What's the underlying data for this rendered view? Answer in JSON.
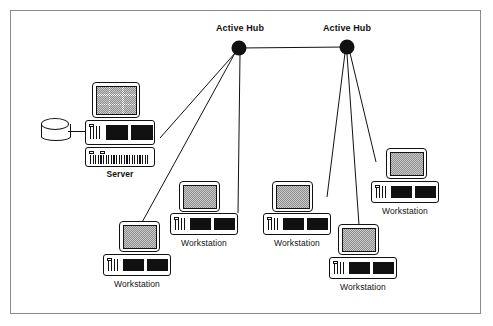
{
  "diagram": {
    "background": "#ffffff",
    "frame_color": "#8a8a8a",
    "line_color": "#111111"
  },
  "hubs": [
    {
      "id": "hub-left",
      "label": "Active Hub",
      "x": 239,
      "y": 48,
      "radius": 7
    },
    {
      "id": "hub-right",
      "label": "Active Hub",
      "x": 347,
      "y": 47,
      "radius": 7
    }
  ],
  "server": {
    "label": "Server",
    "x": 85,
    "y": 78,
    "has_disk": true,
    "units": [
      "monitor",
      "system-unit",
      "expansion-unit"
    ]
  },
  "storage": {
    "label": "",
    "type": "disk-cylinder"
  },
  "workstations": [
    {
      "id": "ws-bottom-left",
      "label": "Workstation",
      "x": 103,
      "y": 221
    },
    {
      "id": "ws-center-left",
      "label": "Workstation",
      "x": 170,
      "y": 180
    },
    {
      "id": "ws-center-right",
      "label": "Workstation",
      "x": 263,
      "y": 180
    },
    {
      "id": "ws-bottom-right",
      "label": "Workstation",
      "x": 329,
      "y": 224
    },
    {
      "id": "ws-right",
      "label": "Workstation",
      "x": 371,
      "y": 145
    }
  ],
  "connections": [
    {
      "from": "hub-left",
      "to": "hub-right",
      "type": "backbone"
    },
    {
      "from": "hub-left",
      "to": "server",
      "type": "drop"
    },
    {
      "from": "hub-left",
      "to": "ws-bottom-left",
      "type": "drop"
    },
    {
      "from": "hub-left",
      "to": "ws-center-left",
      "type": "drop"
    },
    {
      "from": "hub-right",
      "to": "ws-center-right",
      "type": "drop"
    },
    {
      "from": "hub-right",
      "to": "ws-bottom-right",
      "type": "drop"
    },
    {
      "from": "hub-right",
      "to": "ws-right",
      "type": "drop"
    }
  ]
}
